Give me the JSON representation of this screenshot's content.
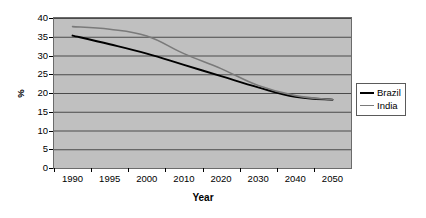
{
  "chart_data": {
    "type": "line",
    "title": "",
    "xlabel": "Year",
    "ylabel": "%",
    "x": [
      1990,
      1995,
      2000,
      2010,
      2020,
      2030,
      2040,
      2050
    ],
    "xtick_labels": [
      "1990",
      "1995",
      "2000",
      "2010",
      "2020",
      "2030",
      "2040",
      "2050"
    ],
    "ytick_labels": [
      "0",
      "5",
      "10",
      "15",
      "20",
      "25",
      "30",
      "35",
      "40"
    ],
    "ytick_values": [
      0,
      5,
      10,
      15,
      20,
      25,
      30,
      35,
      40
    ],
    "ylim": [
      0,
      40
    ],
    "grid": "horizontal",
    "legend_position": "right",
    "plot_background": "#c0c0c0",
    "series": [
      {
        "name": "Brazil",
        "color": "#000000",
        "values": [
          35.3,
          33.0,
          30.5,
          27.5,
          24.5,
          21.5,
          19.0,
          18.2
        ]
      },
      {
        "name": "India",
        "color": "#7a7a7a",
        "values": [
          37.7,
          37.0,
          35.2,
          30.5,
          26.5,
          22.0,
          19.3,
          18.2
        ]
      }
    ]
  },
  "legend": {
    "items": [
      {
        "label": "Brazil",
        "color": "#000000"
      },
      {
        "label": "India",
        "color": "#7a7a7a"
      }
    ]
  }
}
